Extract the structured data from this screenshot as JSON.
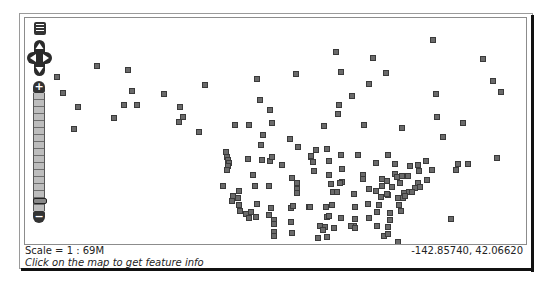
{
  "map": {
    "scale_label": "Scale = 1 : 69M",
    "cursor_coordinates": "-142.85740, 42.06620",
    "info_message": "Click on the map to get feature info",
    "point_color": "#6a6a6a",
    "controls": {
      "layer_switcher": "layers-icon",
      "pan": [
        "pan-up",
        "pan-left",
        "pan-right",
        "pan-down"
      ],
      "zoom_in_label": "+",
      "zoom_out_label": "−",
      "zoom_levels": 17,
      "zoom_handle_level": 3
    },
    "points": [
      [
        57,
        77
      ],
      [
        97,
        66
      ],
      [
        128,
        70
      ],
      [
        63,
        93
      ],
      [
        132,
        91
      ],
      [
        78,
        107
      ],
      [
        124,
        105
      ],
      [
        137,
        105
      ],
      [
        114,
        118
      ],
      [
        74,
        129
      ],
      [
        164,
        94
      ],
      [
        205,
        85
      ],
      [
        180,
        107
      ],
      [
        183,
        117
      ],
      [
        179,
        122
      ],
      [
        199,
        132
      ],
      [
        336,
        52
      ],
      [
        373,
        58
      ],
      [
        341,
        72
      ],
      [
        386,
        73
      ],
      [
        296,
        74
      ],
      [
        257,
        79
      ],
      [
        369,
        84
      ],
      [
        352,
        96
      ],
      [
        260,
        100
      ],
      [
        339,
        105
      ],
      [
        270,
        110
      ],
      [
        338,
        114
      ],
      [
        272,
        123
      ],
      [
        235,
        125
      ],
      [
        249,
        125
      ],
      [
        324,
        126
      ],
      [
        364,
        125
      ],
      [
        263,
        135
      ],
      [
        290,
        139
      ],
      [
        433,
        40
      ],
      [
        483,
        59
      ],
      [
        493,
        81
      ],
      [
        501,
        92
      ],
      [
        436,
        94
      ],
      [
        437,
        117
      ],
      [
        463,
        123
      ],
      [
        402,
        128
      ],
      [
        443,
        137
      ],
      [
        497,
        158
      ],
      [
        426,
        161
      ],
      [
        458,
        164
      ],
      [
        468,
        164
      ],
      [
        410,
        166
      ],
      [
        418,
        165
      ],
      [
        419,
        171
      ],
      [
        432,
        170
      ],
      [
        456,
        170
      ],
      [
        261,
        145
      ],
      [
        298,
        147
      ],
      [
        226,
        152
      ],
      [
        227,
        157
      ],
      [
        228,
        160
      ],
      [
        229,
        163
      ],
      [
        248,
        159
      ],
      [
        262,
        160
      ],
      [
        270,
        161
      ],
      [
        272,
        157
      ],
      [
        311,
        157
      ],
      [
        282,
        165
      ],
      [
        228,
        166
      ],
      [
        227,
        170
      ],
      [
        253,
        175
      ],
      [
        292,
        178
      ],
      [
        223,
        186
      ],
      [
        255,
        186
      ],
      [
        269,
        186
      ],
      [
        297,
        183
      ],
      [
        297,
        189
      ],
      [
        297,
        193
      ],
      [
        239,
        191
      ],
      [
        233,
        196
      ],
      [
        238,
        198
      ],
      [
        232,
        201
      ],
      [
        239,
        205
      ],
      [
        257,
        204
      ],
      [
        271,
        208
      ],
      [
        291,
        208
      ],
      [
        293,
        206
      ],
      [
        309,
        207
      ],
      [
        240,
        211
      ],
      [
        246,
        214
      ],
      [
        251,
        212
      ],
      [
        249,
        218
      ],
      [
        256,
        217
      ],
      [
        269,
        215
      ],
      [
        274,
        220
      ],
      [
        274,
        224
      ],
      [
        291,
        222
      ],
      [
        274,
        232
      ],
      [
        274,
        236
      ],
      [
        292,
        233
      ],
      [
        320,
        226
      ],
      [
        316,
        150
      ],
      [
        327,
        149
      ],
      [
        311,
        156
      ],
      [
        341,
        155
      ],
      [
        358,
        155
      ],
      [
        313,
        162
      ],
      [
        329,
        161
      ],
      [
        342,
        169
      ],
      [
        388,
        155
      ],
      [
        376,
        163
      ],
      [
        395,
        164
      ],
      [
        314,
        171
      ],
      [
        329,
        175
      ],
      [
        342,
        182
      ],
      [
        363,
        175
      ],
      [
        363,
        179
      ],
      [
        395,
        174
      ],
      [
        382,
        179
      ],
      [
        387,
        181
      ],
      [
        397,
        177
      ],
      [
        402,
        176
      ],
      [
        408,
        176
      ],
      [
        331,
        184
      ],
      [
        340,
        183
      ],
      [
        382,
        186
      ],
      [
        392,
        187
      ],
      [
        369,
        189
      ],
      [
        333,
        192
      ],
      [
        337,
        192
      ],
      [
        354,
        194
      ],
      [
        376,
        191
      ],
      [
        388,
        195
      ],
      [
        404,
        193
      ],
      [
        409,
        192
      ],
      [
        403,
        198
      ],
      [
        398,
        198
      ],
      [
        310,
        207
      ],
      [
        326,
        207
      ],
      [
        332,
        205
      ],
      [
        355,
        207
      ],
      [
        368,
        204
      ],
      [
        379,
        205
      ],
      [
        399,
        205
      ],
      [
        401,
        211
      ],
      [
        327,
        217
      ],
      [
        329,
        216
      ],
      [
        341,
        218
      ],
      [
        355,
        219
      ],
      [
        369,
        218
      ],
      [
        377,
        212
      ],
      [
        390,
        213
      ],
      [
        354,
        226
      ],
      [
        325,
        227
      ],
      [
        323,
        230
      ],
      [
        334,
        228
      ],
      [
        351,
        226
      ],
      [
        355,
        228
      ],
      [
        377,
        226
      ],
      [
        388,
        227
      ],
      [
        318,
        238
      ],
      [
        327,
        237
      ],
      [
        384,
        236
      ],
      [
        388,
        234
      ],
      [
        398,
        242
      ],
      [
        418,
        183
      ],
      [
        427,
        180
      ],
      [
        415,
        188
      ],
      [
        412,
        192
      ],
      [
        420,
        187
      ],
      [
        405,
        196
      ],
      [
        400,
        183
      ],
      [
        387,
        194
      ],
      [
        381,
        197
      ],
      [
        390,
        220
      ],
      [
        451,
        219
      ]
    ]
  }
}
